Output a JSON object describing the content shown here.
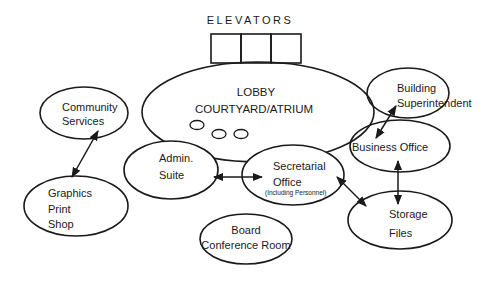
{
  "diagram": {
    "elevators": {
      "label": "ELEVATORS",
      "count": 3
    },
    "nodes": {
      "lobby": {
        "lines": [
          "LOBBY",
          "COURTYARD/ATRIUM"
        ]
      },
      "community": {
        "lines": [
          "Community",
          "Services"
        ]
      },
      "graphics": {
        "lines": [
          "Graphics",
          "Print",
          "Shop"
        ]
      },
      "admin": {
        "lines": [
          "Admin.",
          "Suite"
        ]
      },
      "secretarial": {
        "lines": [
          "Secretarial",
          "Office"
        ],
        "note": "(Including Personnel)"
      },
      "board": {
        "lines": [
          "Board",
          "Conference Room"
        ]
      },
      "building": {
        "lines": [
          "Building",
          "Superintendent"
        ]
      },
      "business": {
        "lines": [
          "Business Office"
        ]
      },
      "storage": {
        "lines": [
          "Storage",
          "Files"
        ]
      }
    },
    "connections": [
      {
        "from": "community",
        "to": "graphics",
        "type": "bidirectional"
      },
      {
        "from": "admin",
        "to": "secretarial",
        "type": "bidirectional"
      },
      {
        "from": "secretarial",
        "to": "storage",
        "type": "bidirectional"
      },
      {
        "from": "building",
        "to": "business",
        "type": "bidirectional"
      },
      {
        "from": "business",
        "to": "storage",
        "type": "bidirectional"
      }
    ]
  }
}
